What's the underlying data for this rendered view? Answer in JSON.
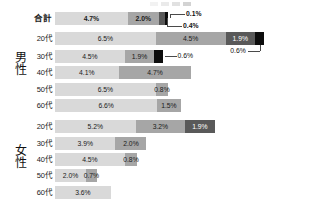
{
  "legend": {
    "visible_fragment": true,
    "swatch_colors": [
      "#d9d9d9",
      "#a6a6a6",
      "#595959",
      "#0d0d0d"
    ]
  },
  "colors": {
    "series1": "#d9d9d9",
    "series2": "#a6a6a6",
    "series3": "#595959",
    "series4": "#0d0d0d",
    "text": "#1a1a1a",
    "leader": "#4a4a4a",
    "background": "#ffffff"
  },
  "groups": [
    {
      "label": "男性"
    },
    {
      "label": "女性"
    }
  ],
  "rows": [
    {
      "label": "合計",
      "is_total": true,
      "segments": [
        {
          "value": 4.7,
          "display": "4.7%",
          "series": 1,
          "inside": true
        },
        {
          "value": 2.0,
          "display": "2.0%",
          "series": 2,
          "inside": true
        },
        {
          "value": 0.4,
          "display": "0.4%",
          "series": 3,
          "inside": false
        },
        {
          "value": 0.1,
          "display": "0.1%",
          "series": 4,
          "inside": false
        }
      ]
    },
    {
      "label": "20代",
      "is_total": false,
      "segments": [
        {
          "value": 6.5,
          "display": "6.5%",
          "series": 1,
          "inside": true
        },
        {
          "value": 4.5,
          "display": "4.5%",
          "series": 2,
          "inside": true
        },
        {
          "value": 1.9,
          "display": "1.9%",
          "series": 3,
          "inside": true
        },
        {
          "value": 0.6,
          "display": "0.6%",
          "series": 4,
          "inside": false
        }
      ]
    },
    {
      "label": "30代",
      "is_total": false,
      "segments": [
        {
          "value": 4.5,
          "display": "4.5%",
          "series": 1,
          "inside": true
        },
        {
          "value": 1.9,
          "display": "1.9%",
          "series": 2,
          "inside": true
        },
        {
          "value": 0.6,
          "display": "0.6%",
          "series": 4,
          "inside": false
        }
      ]
    },
    {
      "label": "40代",
      "is_total": false,
      "segments": [
        {
          "value": 4.1,
          "display": "4.1%",
          "series": 1,
          "inside": true
        },
        {
          "value": 4.7,
          "display": "4.7%",
          "series": 2,
          "inside": true
        }
      ]
    },
    {
      "label": "50代",
      "is_total": false,
      "segments": [
        {
          "value": 6.5,
          "display": "6.5%",
          "series": 1,
          "inside": true
        },
        {
          "value": 0.8,
          "display": "0.8%",
          "series": 2,
          "inside": true
        }
      ]
    },
    {
      "label": "60代",
      "is_total": false,
      "segments": [
        {
          "value": 6.6,
          "display": "6.6%",
          "series": 1,
          "inside": true
        },
        {
          "value": 1.5,
          "display": "1.5%",
          "series": 2,
          "inside": true
        }
      ]
    },
    {
      "label": "20代",
      "is_total": false,
      "segments": [
        {
          "value": 5.2,
          "display": "5.2%",
          "series": 1,
          "inside": true
        },
        {
          "value": 3.2,
          "display": "3.2%",
          "series": 2,
          "inside": true
        },
        {
          "value": 1.9,
          "display": "1.9%",
          "series": 3,
          "inside": true
        }
      ]
    },
    {
      "label": "30代",
      "is_total": false,
      "segments": [
        {
          "value": 3.9,
          "display": "3.9%",
          "series": 1,
          "inside": true
        },
        {
          "value": 2.0,
          "display": "2.0%",
          "series": 2,
          "inside": true
        }
      ]
    },
    {
      "label": "40代",
      "is_total": false,
      "segments": [
        {
          "value": 4.5,
          "display": "4.5%",
          "series": 1,
          "inside": true
        },
        {
          "value": 0.8,
          "display": "0.8%",
          "series": 2,
          "inside": true
        }
      ]
    },
    {
      "label": "50代",
      "is_total": false,
      "segments": [
        {
          "value": 2.0,
          "display": "2.0%",
          "series": 1,
          "inside": true
        },
        {
          "value": 0.7,
          "display": "0.7%",
          "series": 2,
          "inside": true
        }
      ]
    },
    {
      "label": "60代",
      "is_total": false,
      "segments": [
        {
          "value": 3.6,
          "display": "3.6%",
          "series": 1,
          "inside": true
        }
      ]
    }
  ],
  "callouts": [
    {
      "text": "0.1%",
      "row": 0,
      "note": "points to 4th black segment of 合計"
    },
    {
      "text": "0.4%",
      "row": 0,
      "note": "points to 3rd dark segment of 合計"
    },
    {
      "text": "0.6%",
      "row": 1,
      "note": "points to 4th black segment of male 20代"
    },
    {
      "text": "0.6%",
      "row": 2,
      "note": "points to 4th black segment of male 30代"
    }
  ],
  "chart_data": {
    "type": "bar",
    "title": "",
    "xlabel": "",
    "ylabel": "",
    "orientation": "horizontal",
    "stacked": true,
    "grid": false,
    "legend_position": "top-right (cropped)",
    "categories": [
      "合計",
      "男性 20代",
      "男性 30代",
      "男性 40代",
      "男性 50代",
      "男性 60代",
      "女性 20代",
      "女性 30代",
      "女性 40代",
      "女性 50代",
      "女性 60代"
    ],
    "series": [
      {
        "name": "系列1",
        "color": "#d9d9d9",
        "values": [
          4.7,
          6.5,
          4.5,
          4.1,
          6.5,
          6.6,
          5.2,
          3.9,
          4.5,
          2.0,
          3.6
        ]
      },
      {
        "name": "系列2",
        "color": "#a6a6a6",
        "values": [
          2.0,
          4.5,
          1.9,
          4.7,
          0.8,
          1.5,
          3.2,
          2.0,
          0.8,
          0.7,
          0
        ]
      },
      {
        "name": "系列3",
        "color": "#595959",
        "values": [
          0.4,
          1.9,
          0,
          0,
          0,
          0,
          1.9,
          0,
          0,
          0,
          0
        ]
      },
      {
        "name": "系列4",
        "color": "#0d0d0d",
        "values": [
          0.1,
          0.6,
          0.6,
          0,
          0,
          0,
          0,
          0,
          0,
          0,
          0
        ]
      }
    ],
    "xlim": [
      0,
      14
    ]
  }
}
